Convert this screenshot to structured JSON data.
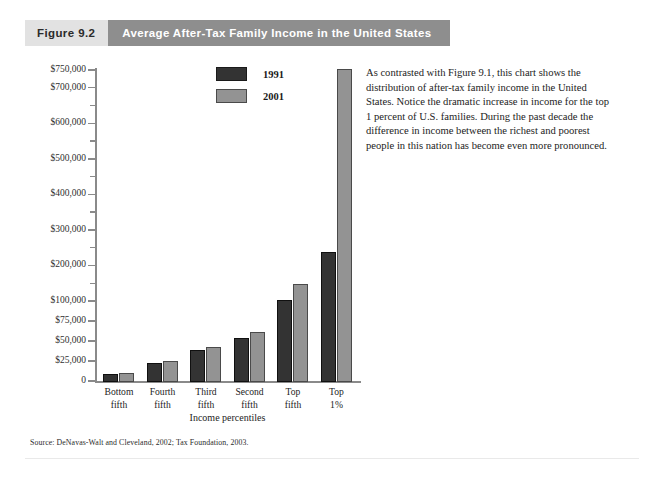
{
  "header": {
    "figure_number": "Figure 9.2",
    "title": "Average After-Tax Family Income in the United States"
  },
  "legend": {
    "items": [
      {
        "label": "1991",
        "color": "#333333"
      },
      {
        "label": "2001",
        "color": "#939393"
      }
    ]
  },
  "annotation": "As contrasted with Figure 9.1, this chart shows the distribution of after-tax family income in the United States. Notice the dramatic increase in income for the top 1 percent of U.S. families. During the past decade the difference in income between the richest and poorest people in this nation has become even more pronounced.",
  "source": "Source: DeNavas-Walt and Cleveland, 2002; Tax Foundation, 2003.",
  "chart_data": {
    "type": "bar",
    "title": "Average After-Tax Family Income in the United States",
    "xlabel": "Income percentiles",
    "ylabel": "",
    "categories": [
      "Bottom fifth",
      "Fourth fifth",
      "Third fifth",
      "Second fifth",
      "Top fifth",
      "Top 1%"
    ],
    "category_lines": [
      [
        "Bottom",
        "fifth"
      ],
      [
        "Fourth",
        "fifth"
      ],
      [
        "Third",
        "fifth"
      ],
      [
        "Second",
        "fifth"
      ],
      [
        "Top",
        "fifth"
      ],
      [
        "Top",
        "1%"
      ]
    ],
    "series": [
      {
        "name": "1991",
        "color": "#333333",
        "values": [
          10000,
          24000,
          40000,
          55000,
          105000,
          240000
        ]
      },
      {
        "name": "2001",
        "color": "#939393",
        "values": [
          11000,
          26000,
          44000,
          62000,
          150000,
          755000
        ]
      }
    ],
    "ylim": [
      0,
      762000
    ],
    "y_axis_note": "broken / compressed scale below $100,000",
    "y_major_ticks": [
      {
        "value": 0,
        "label": "0"
      },
      {
        "value": 25000,
        "label": "$25,000"
      },
      {
        "value": 50000,
        "label": "$50,000"
      },
      {
        "value": 75000,
        "label": "$75,000"
      },
      {
        "value": 100000,
        "label": "$100,000"
      },
      {
        "value": 200000,
        "label": "$200,000"
      },
      {
        "value": 300000,
        "label": "$300,000"
      },
      {
        "value": 400000,
        "label": "$400,000"
      },
      {
        "value": 500000,
        "label": "$500,000"
      },
      {
        "value": 600000,
        "label": "$600,000"
      },
      {
        "value": 700000,
        "label": "$700,000"
      },
      {
        "value": 750000,
        "label": "$750,000"
      }
    ],
    "y_minor_ticks": [
      150000,
      250000,
      350000,
      450000,
      550000,
      650000
    ],
    "grid": false,
    "legend_position": "upper-center"
  }
}
